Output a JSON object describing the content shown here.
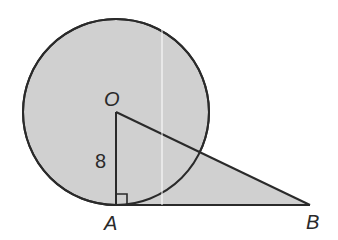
{
  "diagram": {
    "colors": {
      "fill": "#d0d0d0",
      "stroke": "#2a2a2a",
      "background": "#ffffff"
    },
    "points": {
      "O": {
        "label": "O",
        "x": 116,
        "y": 112
      },
      "A": {
        "label": "A",
        "x": 116,
        "y": 205
      },
      "B": {
        "label": "B",
        "x": 310,
        "y": 205
      }
    },
    "circle": {
      "center": "O",
      "radius": 93
    },
    "segments": [
      {
        "from": "O",
        "to": "A"
      },
      {
        "from": "A",
        "to": "B"
      },
      {
        "from": "O",
        "to": "B"
      }
    ],
    "right_angle_marker": {
      "at": "A"
    },
    "measurements": {
      "OA": "8"
    }
  }
}
